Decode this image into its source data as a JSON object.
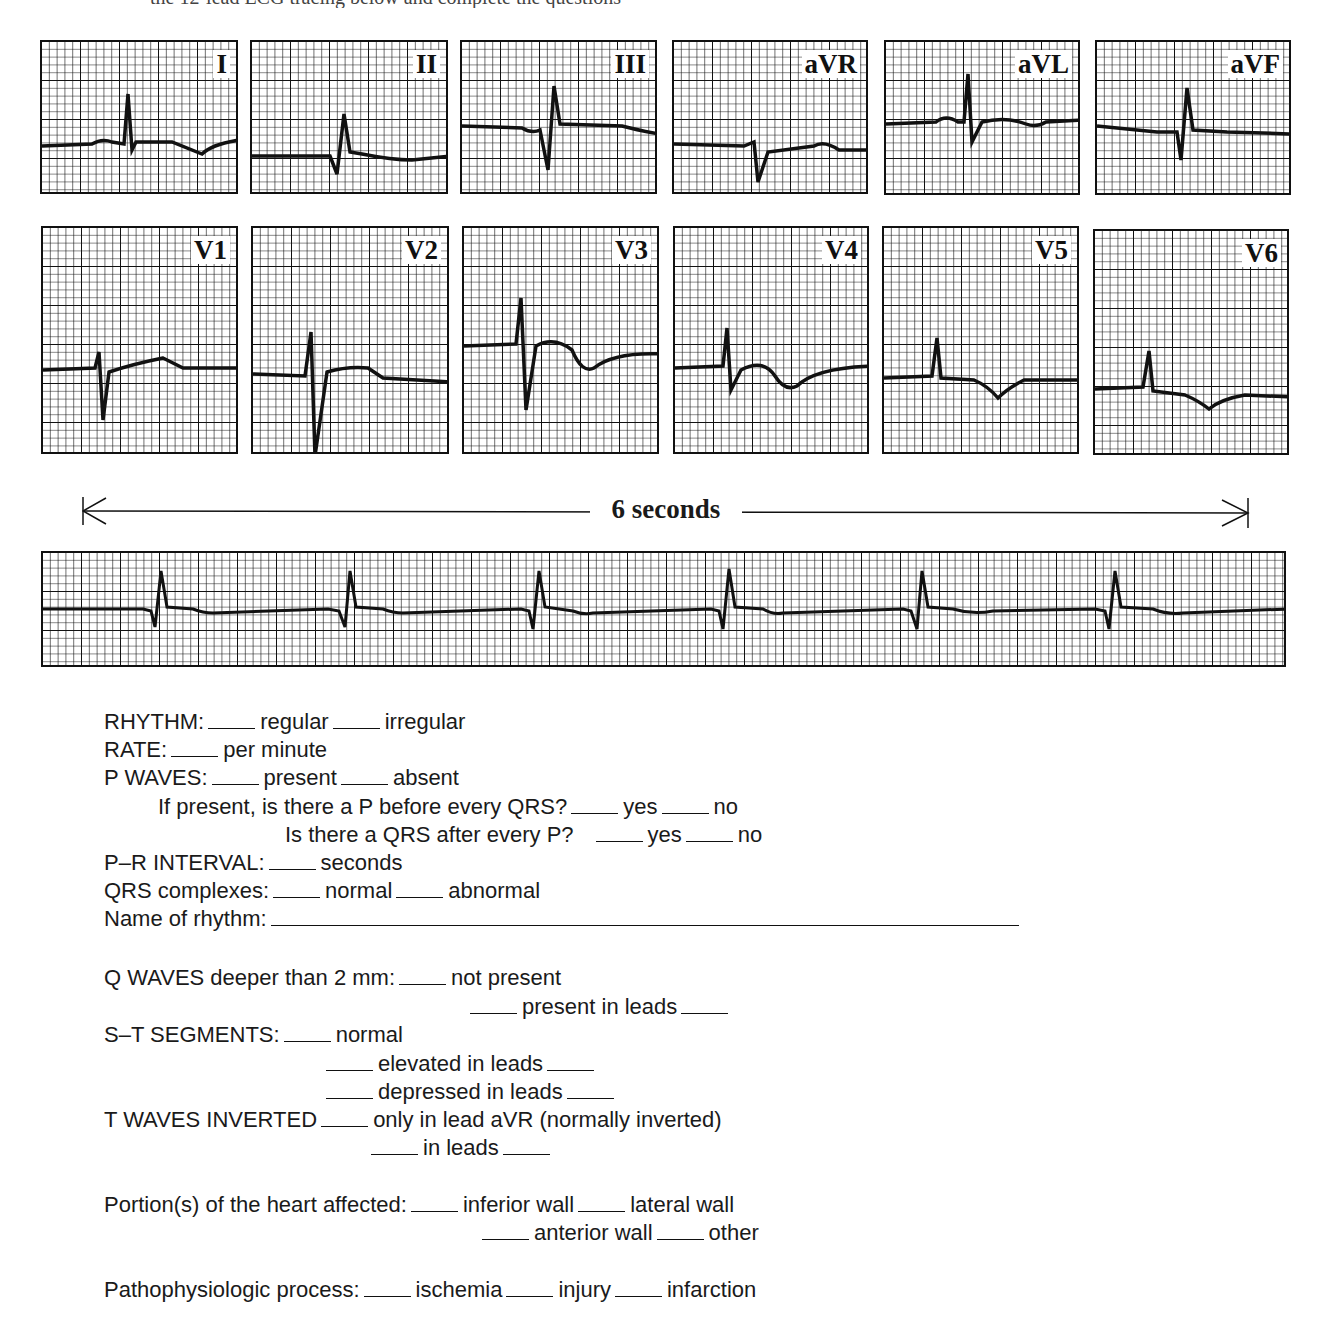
{
  "page": {
    "top_cutoff_text": "the 12-lead ECG tracing below and complete the questions"
  },
  "ecg_leads": [
    {
      "label": "I"
    },
    {
      "label": "II"
    },
    {
      "label": "III"
    },
    {
      "label": "aVR"
    },
    {
      "label": "aVL"
    },
    {
      "label": "aVF"
    },
    {
      "label": "V1"
    },
    {
      "label": "V2"
    },
    {
      "label": "V3"
    },
    {
      "label": "V4"
    },
    {
      "label": "V5"
    },
    {
      "label": "V6"
    }
  ],
  "rhythm_strip": {
    "duration_label": "6 seconds",
    "beats_visible": 7
  },
  "colors": {
    "grid": "#111111",
    "trace": "#111111",
    "paper": "#ffffff"
  },
  "form": {
    "rhythm": {
      "label": "RHYTHM:",
      "opt1": "regular",
      "opt2": "irregular"
    },
    "rate": {
      "label": "RATE:",
      "suffix": "per minute"
    },
    "p_waves": {
      "label": "P WAVES:",
      "opt1": "present",
      "opt2": "absent"
    },
    "p_before_qrs": {
      "label": "If present, is there a P before every QRS?",
      "opt1": "yes",
      "opt2": "no"
    },
    "qrs_after_p": {
      "label": "Is there a QRS after every P?",
      "opt1": "yes",
      "opt2": "no"
    },
    "pr_interval": {
      "label": "P–R INTERVAL:",
      "suffix": "seconds"
    },
    "qrs_complexes": {
      "label": "QRS complexes:",
      "opt1": "normal",
      "opt2": "abnormal"
    },
    "name_of_rhythm": {
      "label": "Name of rhythm:"
    },
    "q_waves": {
      "label": "Q WAVES deeper than 2 mm:",
      "opt1": "not present",
      "opt2": "present in leads"
    },
    "st_segments": {
      "label": "S–T SEGMENTS:",
      "opt1": "normal",
      "opt2": "elevated in leads",
      "opt3": "depressed in leads"
    },
    "t_waves": {
      "label": "T WAVES INVERTED",
      "opt1": "only in lead aVR (normally inverted)",
      "opt2": "in leads"
    },
    "portions": {
      "label": "Portion(s) of the heart affected:",
      "opt1": "inferior wall",
      "opt2": "lateral wall",
      "opt3": "anterior wall",
      "opt4": "other"
    },
    "process": {
      "label": "Pathophysiologic process:",
      "opt1": "ischemia",
      "opt2": "injury",
      "opt3": "infarction"
    }
  }
}
